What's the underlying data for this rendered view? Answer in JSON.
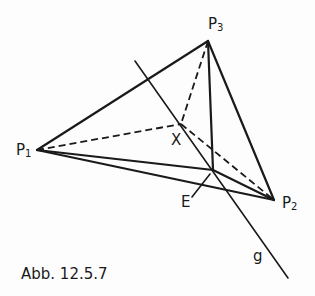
{
  "figure": {
    "caption": "Abb. 12.5.7",
    "points": {
      "P1": {
        "label": "P",
        "sub": "1",
        "x": 37,
        "y": 150
      },
      "P2": {
        "label": "P",
        "sub": "2",
        "x": 274,
        "y": 200
      },
      "P3": {
        "label": "P",
        "sub": "3",
        "x": 208,
        "y": 41
      },
      "X": {
        "label": "X",
        "x": 181,
        "y": 124
      },
      "E": {
        "label": "E",
        "x": 213,
        "y": 170
      }
    },
    "line_g": {
      "label": "g",
      "from": [
        135,
        61
      ],
      "to": [
        288,
        278
      ]
    },
    "segments": {
      "solid": [
        [
          "P1",
          "P3"
        ],
        [
          "P3",
          "P2"
        ],
        [
          "P1",
          "P2"
        ],
        [
          "P1",
          "E"
        ],
        [
          "E",
          "P2"
        ],
        [
          "P3",
          "E"
        ]
      ],
      "dashed": [
        [
          "P1",
          "X"
        ],
        [
          "P3",
          "X"
        ],
        [
          "X",
          "P2"
        ]
      ]
    },
    "colors": {
      "ink": "#1a1a1a",
      "paper": "#fdfdfd"
    }
  }
}
